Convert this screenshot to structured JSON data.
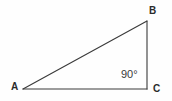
{
  "figure": {
    "kind": "right-triangle-diagram",
    "background_color": "#fefefe",
    "stroke_color": "#3a3a3a",
    "label_color": "#2b2b2b",
    "angle_label_color": "#3a3a3a",
    "vertices": {
      "a": {
        "label": "A",
        "x": 23,
        "y": 89
      },
      "b": {
        "label": "B",
        "x": 147,
        "y": 21
      },
      "c": {
        "label": "C",
        "x": 147,
        "y": 89
      }
    },
    "angle": {
      "label": "90°",
      "at_vertex": "C",
      "x": 132,
      "y": 75
    },
    "sides": [
      {
        "name": "hypotenuse-ab",
        "from": "A",
        "to": "B"
      },
      {
        "name": "side-bc",
        "from": "B",
        "to": "C"
      },
      {
        "name": "side-ac",
        "from": "A",
        "to": "C"
      }
    ]
  }
}
